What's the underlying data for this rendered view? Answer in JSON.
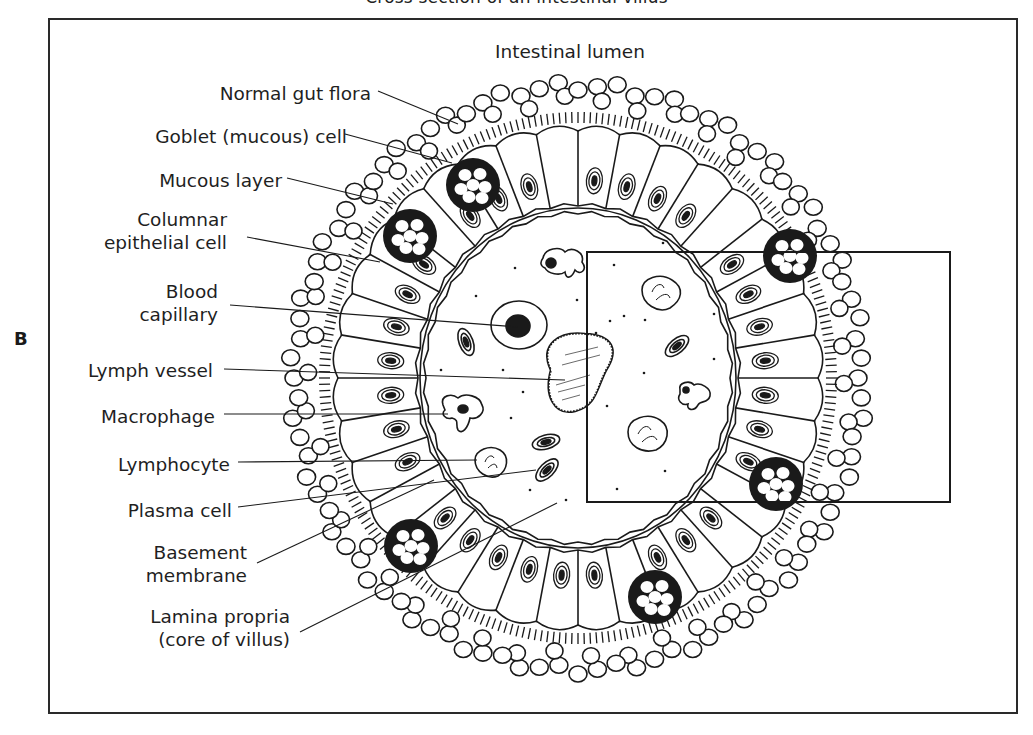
{
  "figure": {
    "title_clipped": "Cross section of an intestinal villus",
    "panel_letter": "B",
    "region_label": "Intestinal lumen"
  },
  "labels": [
    {
      "id": "normal-gut-flora",
      "lines": [
        "Normal gut flora"
      ]
    },
    {
      "id": "goblet-cell",
      "lines": [
        "Goblet (mucous) cell"
      ]
    },
    {
      "id": "mucous-layer",
      "lines": [
        "Mucous layer"
      ]
    },
    {
      "id": "columnar-epithelial-cell",
      "lines": [
        "Columnar",
        "epithelial cell"
      ]
    },
    {
      "id": "blood-capillary",
      "lines": [
        "Blood",
        "capillary"
      ]
    },
    {
      "id": "lymph-vessel",
      "lines": [
        "Lymph vessel"
      ]
    },
    {
      "id": "macrophage",
      "lines": [
        "Macrophage"
      ]
    },
    {
      "id": "lymphocyte",
      "lines": [
        "Lymphocyte"
      ]
    },
    {
      "id": "plasma-cell",
      "lines": [
        "Plasma cell"
      ]
    },
    {
      "id": "basement-membrane",
      "lines": [
        "Basement",
        "membrane"
      ]
    },
    {
      "id": "lamina-propria",
      "lines": [
        "Lamina propria",
        "(core of villus)"
      ]
    }
  ],
  "colors": {
    "ink": "#1a1a1a",
    "background": "#ffffff"
  },
  "inset_box": {
    "x": 587,
    "y": 252,
    "width": 363,
    "height": 250
  }
}
